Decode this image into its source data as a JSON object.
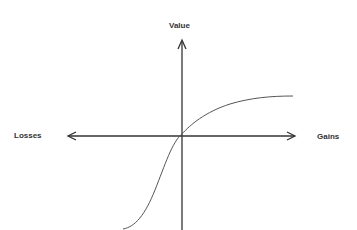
{
  "diagram": {
    "axes": {
      "y_label": "Value",
      "x_negative_label": "Losses",
      "x_positive_label": "Gains"
    },
    "curve": {
      "description": "S-shaped value curve: concave for gains, convex and steeper for losses, passing through origin",
      "color": "#555555"
    },
    "colors": {
      "axis": "#333333",
      "text": "#333333",
      "background": "#ffffff"
    }
  }
}
